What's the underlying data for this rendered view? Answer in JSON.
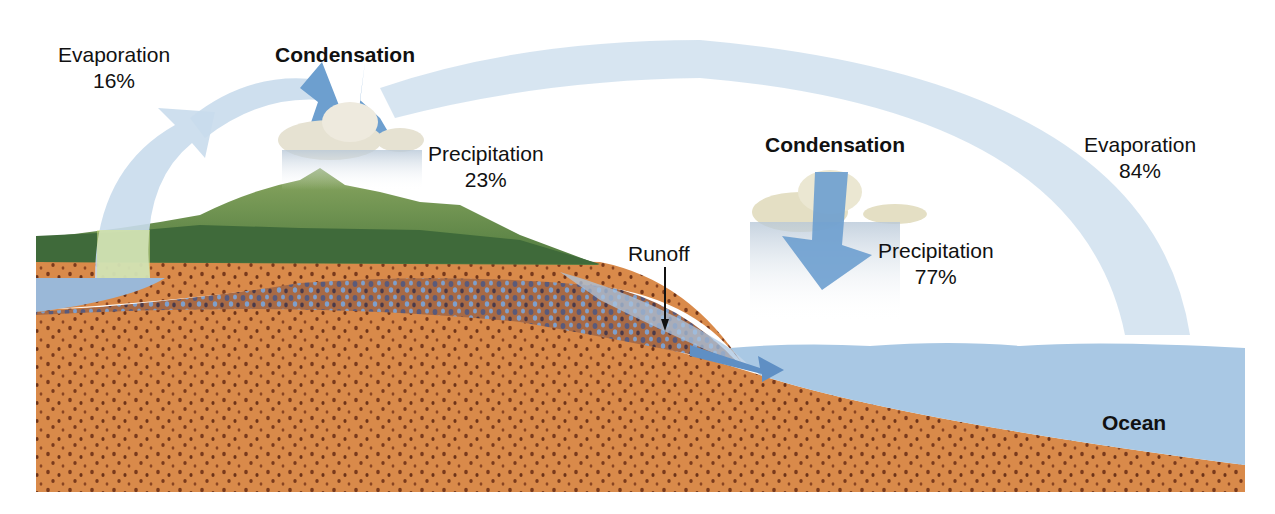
{
  "diagram": {
    "labels": {
      "evaporation_land": {
        "name": "Evaporation",
        "value": "16%"
      },
      "condensation_land": {
        "name": "Condensation"
      },
      "precipitation_land": {
        "name": "Precipitation",
        "value": "23%"
      },
      "runoff": {
        "name": "Runoff"
      },
      "condensation_ocean": {
        "name": "Condensation"
      },
      "precipitation_ocean": {
        "name": "Precipitation",
        "value": "77%"
      },
      "evaporation_ocean": {
        "name": "Evaporation",
        "value": "84%"
      },
      "ocean": {
        "name": "Ocean"
      }
    },
    "colors": {
      "arrow_light": "#c9dcec",
      "arrow_dark": "#6d9fcf",
      "ocean": "#a9c8e4",
      "soil": "#d98a4a",
      "soil_dots": "#7a3a1c",
      "aquifer": "#8a6a6a",
      "groundwater_blue": "#7f9fcb",
      "mountain": "#7a9a4a",
      "forest": "#3f6a3a",
      "cloud": "#e6e2d2"
    }
  }
}
